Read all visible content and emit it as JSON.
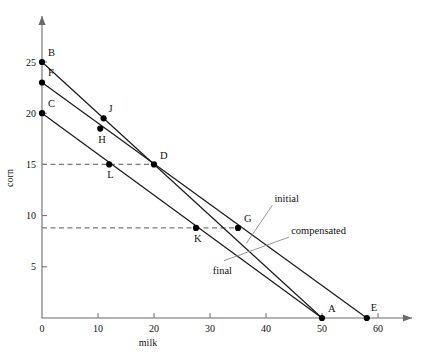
{
  "chart_data": {
    "type": "line",
    "title": "",
    "xlabel": "milk",
    "ylabel": "corn",
    "xlim": [
      0,
      63
    ],
    "ylim": [
      0,
      27.5
    ],
    "xticks": [
      0,
      10,
      20,
      30,
      40,
      50,
      60
    ],
    "yticks": [
      5,
      10,
      15,
      20,
      25
    ],
    "xtick_labels": [
      "0",
      "10",
      "20",
      "30",
      "40",
      "50",
      "60"
    ],
    "ytick_labels": [
      "5",
      "10",
      "15",
      "20",
      "25"
    ],
    "grid": false,
    "legend_position": "inline-annotations",
    "series": [
      {
        "name": "initial",
        "label": "initial",
        "points": [
          [
            0,
            25
          ],
          [
            50,
            0
          ]
        ],
        "intercept_corn": 25,
        "intercept_milk": 50
      },
      {
        "name": "compensated",
        "label": "compensated",
        "points": [
          [
            0,
            23
          ],
          [
            58,
            0
          ]
        ],
        "intercept_corn": 23,
        "intercept_milk": 58
      },
      {
        "name": "final",
        "label": "final",
        "points": [
          [
            0,
            20
          ],
          [
            50,
            0
          ]
        ],
        "intercept_corn": 20,
        "intercept_milk": 50
      }
    ],
    "annotations": [
      {
        "name": "B",
        "x": 0,
        "y": 25,
        "label_dx": 6,
        "label_dy": -6
      },
      {
        "name": "F",
        "x": 0,
        "y": 23,
        "label_dx": 6,
        "label_dy": -6
      },
      {
        "name": "C",
        "x": 0,
        "y": 20,
        "label_dx": 6,
        "label_dy": -6
      },
      {
        "name": "J",
        "x": 11,
        "y": 19.5,
        "label_dx": 5,
        "label_dy": -6
      },
      {
        "name": "H",
        "x": 10.4,
        "y": 18.5,
        "label_dx": -2,
        "label_dy": 14
      },
      {
        "name": "D",
        "x": 20,
        "y": 15,
        "label_dx": 6,
        "label_dy": -5
      },
      {
        "name": "L",
        "x": 12,
        "y": 15,
        "label_dx": -2,
        "label_dy": 14
      },
      {
        "name": "G",
        "x": 35,
        "y": 8.8,
        "label_dx": 6,
        "label_dy": -6
      },
      {
        "name": "K",
        "x": 27.5,
        "y": 8.8,
        "label_dx": -2,
        "label_dy": 14
      },
      {
        "name": "A",
        "x": 50,
        "y": 0,
        "label_dx": 6,
        "label_dy": -6
      },
      {
        "name": "E",
        "x": 58,
        "y": 0,
        "label_dx": 4,
        "label_dy": -7
      }
    ],
    "guide_lines": [
      {
        "name": "corn-15-guide",
        "y": 15,
        "x_from": 0,
        "x_to": 20,
        "style": "dashed"
      },
      {
        "name": "corn-8.8-guide",
        "y": 8.8,
        "x_from": 0,
        "x_to": 35,
        "style": "dashed"
      }
    ],
    "curve_labels": [
      {
        "name": "initial",
        "text": "initial",
        "x": 41.5,
        "y": 11.3,
        "leader_to_x": 36.5,
        "leader_to_y": 7.3
      },
      {
        "name": "compensated",
        "text": "compensated",
        "x": 44.5,
        "y": 8.2,
        "leader_to_x": 32.5,
        "leader_to_y": 5.6
      },
      {
        "name": "final",
        "text": "final",
        "x": 30.5,
        "y": 4.3,
        "leader_to_x": null,
        "leader_to_y": null
      }
    ],
    "colors": {
      "axis": "#6b6b6b",
      "line": "#1a1a1a",
      "point": "#000000",
      "dashed": "#7a7a7a",
      "text": "#111111",
      "background": "#ffffff"
    }
  }
}
